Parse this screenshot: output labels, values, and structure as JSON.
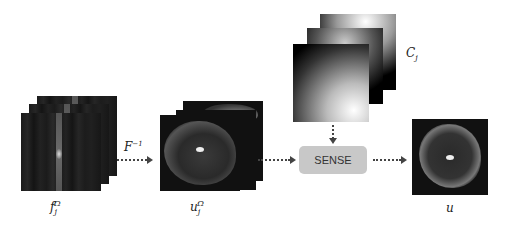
{
  "diagram": {
    "nodes": {
      "kspace": {
        "label": "f_j^Ω",
        "label_main": "f",
        "label_sub": "j",
        "label_sup": "Ω"
      },
      "inverse_fourier": {
        "label": "F⁻¹",
        "label_main": "F",
        "label_sup": "−1"
      },
      "coil_images": {
        "label": "u_j^Ω",
        "label_main": "u",
        "label_sub": "j",
        "label_sup": "Ω"
      },
      "sensitivity_maps": {
        "label": "C_j",
        "label_main": "C",
        "label_sub": "j"
      },
      "sense": {
        "label": "SENSE"
      },
      "output": {
        "label": "u"
      }
    },
    "edges": [
      {
        "from": "kspace",
        "to": "coil_images",
        "label": "F⁻¹",
        "style": "dotted-arrow"
      },
      {
        "from": "coil_images",
        "to": "sense",
        "style": "dotted-arrow"
      },
      {
        "from": "sensitivity_maps",
        "to": "sense",
        "style": "dotted-arrow"
      },
      {
        "from": "sense",
        "to": "output",
        "style": "dotted-arrow"
      }
    ],
    "colors": {
      "sense_box": "#c8c8c8",
      "arrow": "#444444",
      "image_bg": "#111111"
    }
  }
}
